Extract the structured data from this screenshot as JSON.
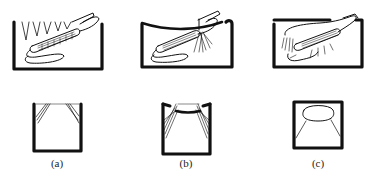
{
  "figure": {
    "panels": [
      {
        "id": "a",
        "label": "(a)",
        "technique_view": "brush bristles angled against tooth surface, tooth cross-section below"
      },
      {
        "id": "b",
        "label": "(b)",
        "technique_view": "brush bristles spread into gumline, tooth cross-section below"
      },
      {
        "id": "c",
        "label": "(c)",
        "technique_view": "brush laid flat over tooth, tooth cross-section below"
      }
    ],
    "colors": {
      "ink": "#111111",
      "paper": "#ffffff"
    }
  }
}
